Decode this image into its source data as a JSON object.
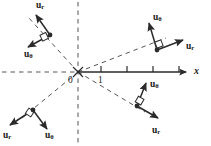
{
  "figure": {
    "type": "vector-diagram",
    "width": 211,
    "height": 146,
    "colors": {
      "stroke": "#2b2b2b",
      "dashed": "#555555",
      "axis": "#2b2b2b",
      "text": "#1a1a1a",
      "background": "#ffffff"
    }
  },
  "axis": {
    "x_label": "x",
    "origin_label": "0",
    "first_tick_label": "1",
    "tick_count": 4,
    "ticks": [
      "1",
      "",
      "",
      ""
    ]
  },
  "vectors": {
    "r_label": "u",
    "r_subscript": "r",
    "theta_label": "u",
    "theta_subscript": "θ"
  },
  "points": [
    {
      "id": "upper-left",
      "quadrant": "II",
      "r_label": "u",
      "r_sub": "r",
      "theta_label": "u",
      "theta_sub": "θ"
    },
    {
      "id": "upper-right",
      "quadrant": "I",
      "r_label": "u",
      "r_sub": "r",
      "theta_label": "u",
      "theta_sub": "θ"
    },
    {
      "id": "lower-right",
      "quadrant": "IV",
      "r_label": "u",
      "r_sub": "r",
      "theta_label": "u",
      "theta_sub": "θ"
    },
    {
      "id": "lower-left",
      "quadrant": "III",
      "r_label": "u",
      "r_sub": "r",
      "theta_label": "u",
      "theta_sub": "θ"
    }
  ],
  "labels": {
    "ul_r": {
      "base": "u",
      "sub": "r"
    },
    "ul_t": {
      "base": "u",
      "sub": "θ"
    },
    "ur_r": {
      "base": "u",
      "sub": "r"
    },
    "ur_t": {
      "base": "u",
      "sub": "θ"
    },
    "lr_r": {
      "base": "u",
      "sub": "r"
    },
    "lr_t": {
      "base": "u",
      "sub": "θ"
    },
    "ll_r": {
      "base": "u",
      "sub": "r"
    },
    "ll_t": {
      "base": "u",
      "sub": "θ"
    },
    "x_axis": "x",
    "origin": "0",
    "tick_one": "1"
  }
}
